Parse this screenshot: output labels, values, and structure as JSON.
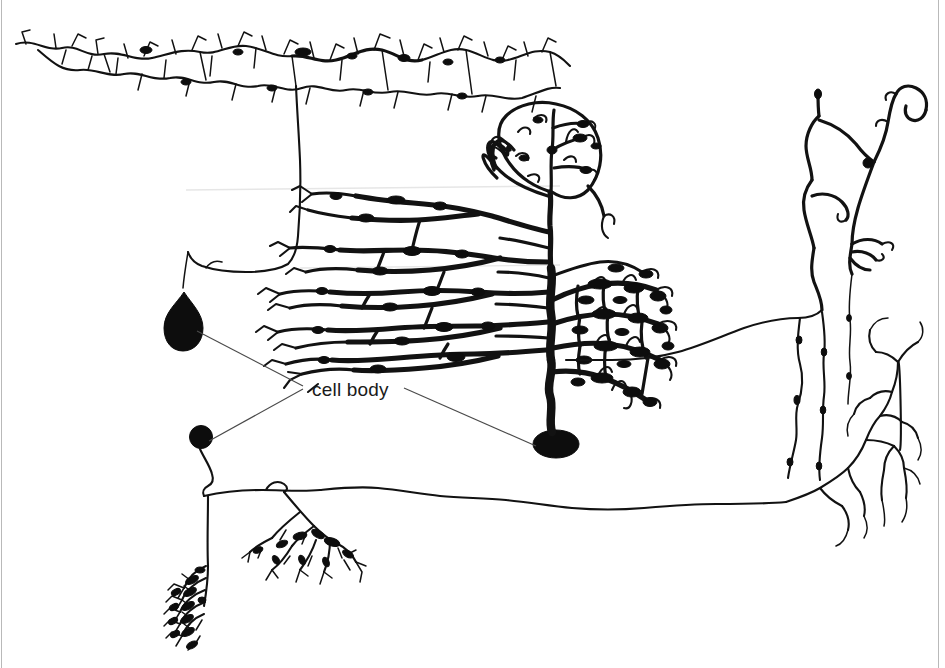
{
  "figure": {
    "background_color": "#ffffff",
    "ink_color": "#121212",
    "leader_line_color": "#4a4a4a",
    "width": 945,
    "height": 668
  },
  "annotations": [
    {
      "id": "cell-body-label",
      "text": "cell body",
      "x": 312,
      "y": 396,
      "font_size": 19,
      "color": "#1a1a1a",
      "leader_targets": [
        "upper-left-pyramidal-soma",
        "lower-left-granule-soma",
        "purkinje-soma"
      ]
    }
  ],
  "leader_lines": [
    {
      "id": "leader-to-upper-left-soma",
      "points": "197,331 303,386"
    },
    {
      "id": "leader-to-lower-left-soma",
      "points": "209,441 303,389"
    },
    {
      "id": "leader-to-purkinje-soma",
      "points": "404,388 536,446"
    }
  ],
  "cells": [
    {
      "id": "upper-left-pyramidal",
      "name": "upper-left-neuron",
      "description": "Neuron with a wide horizontal fan of fine spiny dendrites across the top of the plate, a long descending axon, and a teardrop-shaped cell body at lower left.",
      "soma": {
        "id": "upper-left-pyramidal-soma",
        "cx": 185,
        "cy": 320,
        "rx": 17,
        "ry": 24,
        "shape": "teardrop"
      }
    },
    {
      "id": "purkinje",
      "name": "central-purkinje-neuron",
      "description": "Purkinje cell with a dense flattened fan-shaped dendritic arbor, thick central trunk and an oval cell body at the base.",
      "soma": {
        "id": "purkinje-soma",
        "cx": 556,
        "cy": 444,
        "rx": 22,
        "ry": 14,
        "shape": "oval"
      }
    },
    {
      "id": "lower-left-granule",
      "name": "lower-left-neuron",
      "description": "Small round cell body with a descending axon that splits into two dense terminal tufts, plus a long horizontal axon running to the right margin.",
      "soma": {
        "id": "lower-left-granule-soma",
        "cx": 201,
        "cy": 437,
        "rx": 11,
        "ry": 11,
        "shape": "round"
      }
    },
    {
      "id": "upper-right-sparse",
      "name": "upper-right-neuron",
      "description": "Sparse neuron at the right margin with long wandering unbranched processes, small terminal hooks and several descending beaded fibers.",
      "soma": null
    },
    {
      "id": "lower-right-terminal",
      "name": "lower-right-axon-arbor",
      "description": "Fine branching terminal arborization at the end of the long horizontal axon from the lower-left neuron.",
      "soma": null
    }
  ]
}
